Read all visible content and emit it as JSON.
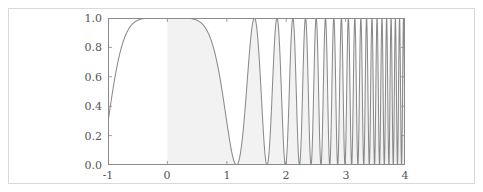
{
  "figure": {
    "background_color": "#ffffff",
    "frame_color": "#d9d9d9"
  },
  "chart_data": {
    "type": "line",
    "title": "",
    "subtitle": "",
    "xlabel": "",
    "ylabel": "",
    "xlim": [
      -1,
      4
    ],
    "ylim": [
      0.0,
      1.0
    ],
    "grid": false,
    "legend": null,
    "xticks": [
      -1,
      0,
      1,
      2,
      3,
      4
    ],
    "xticklabels": [
      "-1",
      "0",
      "1",
      "2",
      "3",
      "4"
    ],
    "yticks": [
      0.0,
      0.2,
      0.4,
      0.6,
      0.8,
      1.0
    ],
    "yticklabels": [
      "0.0",
      "0.2",
      "0.4",
      "0.6",
      "0.8",
      "1.0"
    ],
    "line_color": "#8a8a8a",
    "line_width": 1.1,
    "fill_color": "#f2f2f2",
    "fill_from_x": 0,
    "fill_to_x": 4,
    "fill_baseline": 0.0,
    "function": "cos(x^3)^2",
    "series": [
      {
        "name": "cos(x^3)^2",
        "x": [
          -1,
          -0.9,
          -0.8,
          -0.7,
          -0.6,
          -0.5,
          -0.4,
          -0.3,
          -0.2,
          -0.1,
          0,
          0.1,
          0.2,
          0.3,
          0.4,
          0.45,
          0.5,
          0.6,
          0.7,
          0.8,
          0.9,
          1.0,
          1.1,
          1.15,
          1.2,
          1.3,
          1.4,
          1.5,
          1.55,
          1.6,
          1.7,
          1.8,
          1.83,
          1.9,
          2.0,
          2.05,
          2.1,
          2.2,
          2.25,
          2.3,
          2.4,
          2.5,
          2.55,
          2.6,
          2.7,
          2.8,
          2.9,
          3.0,
          3.1,
          3.2,
          3.3,
          3.4,
          3.5,
          3.6,
          3.7,
          3.8,
          3.9,
          4.0
        ],
        "y": [
          0.87,
          0.91,
          0.95,
          0.98,
          1.0,
          1.0,
          0.99,
          0.98,
          0.97,
          0.96,
          0.96,
          0.74,
          0.38,
          0.1,
          0.0,
          0.0,
          0.03,
          0.23,
          0.55,
          0.84,
          0.98,
          0.99,
          1.0,
          1.0,
          0.97,
          0.71,
          0.29,
          0.01,
          0.0,
          0.05,
          0.57,
          0.97,
          1.0,
          0.91,
          0.31,
          0.08,
          0.0,
          0.65,
          1.0,
          0.92,
          0.11,
          0.21,
          0.72,
          1.0,
          0.38,
          0.0,
          0.86,
          0.55,
          0.0,
          0.8,
          0.21,
          0.45,
          1.0,
          0.05,
          0.6,
          0.38,
          0.88,
          0.0
        ],
        "peaks_x": [
          -0.55,
          1.15,
          1.83,
          2.25,
          2.6,
          2.88,
          3.1,
          3.3,
          3.46,
          3.61,
          3.74,
          3.87,
          3.98
        ],
        "zeros_x": [
          0.45,
          1.53,
          2.09,
          2.41,
          2.73,
          2.98,
          3.2,
          3.39,
          3.55,
          3.69,
          3.82,
          3.94
        ]
      }
    ]
  },
  "y_axis": {
    "ticks": [
      {
        "label": "1.0",
        "value": 1.0
      },
      {
        "label": "0.8",
        "value": 0.8
      },
      {
        "label": "0.6",
        "value": 0.6
      },
      {
        "label": "0.4",
        "value": 0.4
      },
      {
        "label": "0.2",
        "value": 0.2
      },
      {
        "label": "0.0",
        "value": 0.0
      }
    ]
  },
  "x_axis": {
    "ticks": [
      {
        "label": "-1",
        "value": -1
      },
      {
        "label": "0",
        "value": 0
      },
      {
        "label": "1",
        "value": 1
      },
      {
        "label": "2",
        "value": 2
      },
      {
        "label": "3",
        "value": 3
      },
      {
        "label": "4",
        "value": 4
      }
    ]
  }
}
